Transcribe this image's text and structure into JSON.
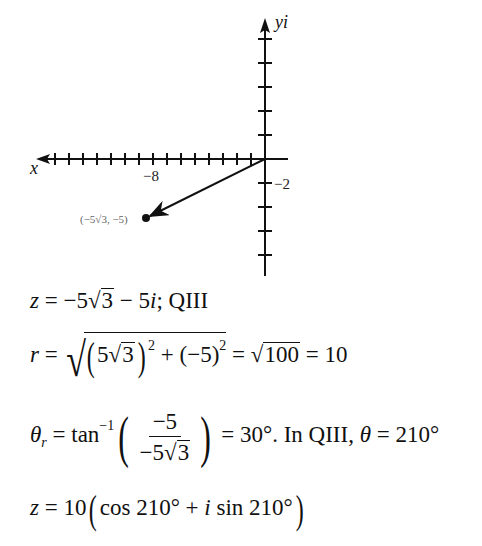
{
  "chart_data": {
    "type": "scatter",
    "title": "",
    "xlabel": "x",
    "ylabel": "yi",
    "grid": false,
    "x_axis": {
      "range": [
        -15,
        1
      ],
      "tick_step": 1,
      "labeled_ticks": [
        {
          "value": -8,
          "label": "−8"
        }
      ]
    },
    "y_axis": {
      "range": [
        -9,
        11
      ],
      "tick_step": 2,
      "labeled_ticks": [
        {
          "value": -2,
          "label": "−2"
        }
      ]
    },
    "points": [
      {
        "x": -8.66,
        "y": -5,
        "label": "(−5√3, −5)"
      }
    ],
    "vectors": [
      {
        "from": [
          0,
          0
        ],
        "to": [
          -8.66,
          -5
        ]
      }
    ]
  },
  "graph": {
    "x_axis_label": "x",
    "y_axis_label": "yi",
    "x_tick_label": "−8",
    "y_tick_label": "−2",
    "point_label": "(−5√3, −5)",
    "colors": {
      "axes": "#111111",
      "point_label": "#666666"
    }
  },
  "equations": {
    "line1": {
      "lhs": "z",
      "eq": " = −5",
      "rad": "3",
      "rest": " − 5",
      "i": "i",
      "tail": ";  QIII"
    },
    "line2": {
      "lhs": "r",
      "eq": " = ",
      "inner_coef": "5",
      "inner_rad": "3",
      "exp1": "2",
      "plus": " + (−5)",
      "exp2": "2",
      "eq2": " = ",
      "rad100": "100",
      "result": " = 10"
    },
    "line3": {
      "theta": "θ",
      "sub": "r",
      "eq": " = tan",
      "inv": "−1",
      "num": "−5",
      "den_coef": "−5",
      "den_rad": "3",
      "result": " = 30°.  In QIII,  ",
      "theta2": "θ",
      "final": " = 210°"
    },
    "line4": {
      "lhs": "z",
      "eq": " = 10",
      "open": "(",
      "cos": "cos 210° + ",
      "i": "i",
      "sin": " sin 210°",
      "close": ")"
    }
  }
}
